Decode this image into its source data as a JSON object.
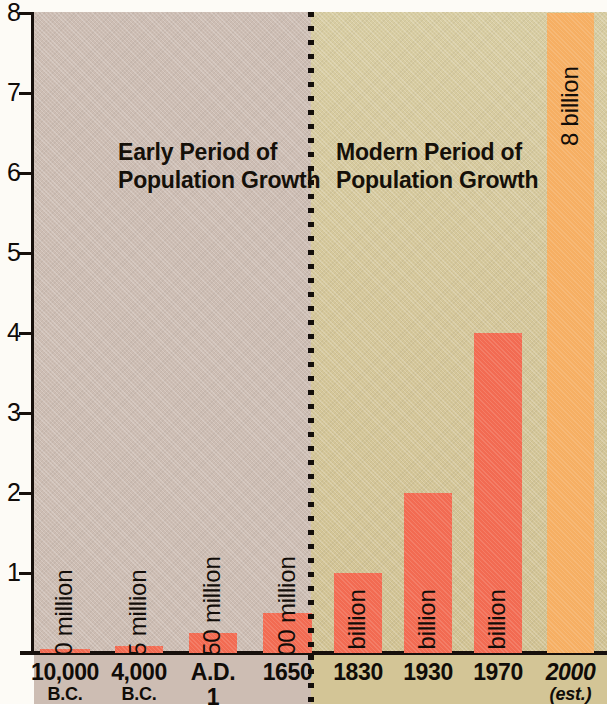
{
  "chart_data": {
    "type": "bar",
    "title": "",
    "xlabel": "",
    "ylabel": "",
    "ylim": [
      0,
      8
    ],
    "yticks": [
      1,
      2,
      3,
      4,
      5,
      6,
      7,
      8
    ],
    "ytick_labels": [
      "1",
      "2",
      "3",
      "4",
      "5",
      "6",
      "7",
      "8"
    ],
    "grid": false,
    "legend": "none",
    "unit_note": "y axis in billions of people",
    "categories": [
      "10,000 B.C.",
      "4,000 B.C.",
      "A.D. 1",
      "1650",
      "1830",
      "1930",
      "1970",
      "2000 (est.)"
    ],
    "values": [
      0.01,
      0.085,
      0.25,
      0.5,
      1,
      2,
      4,
      8
    ],
    "data_labels": [
      "10 million",
      "85 million",
      "250 million",
      "500 million",
      "1 billion",
      "2 billion",
      "4 billion",
      "8 billion"
    ],
    "bar_colors": [
      "#f26b52",
      "#f26b52",
      "#f26b52",
      "#f26b52",
      "#f26b52",
      "#f26b52",
      "#f26b52",
      "#f6af63"
    ],
    "annotations": [
      "Early Period of Population Growth",
      "Modern Period of Population Growth"
    ],
    "panel_divider_after_category": "1650"
  },
  "axis": {
    "ticks": [
      {
        "label": "8",
        "value": 8
      },
      {
        "label": "7",
        "value": 7
      },
      {
        "label": "6",
        "value": 6
      },
      {
        "label": "5",
        "value": 5
      },
      {
        "label": "4",
        "value": 4
      },
      {
        "label": "3",
        "value": 3
      },
      {
        "label": "2",
        "value": 2
      },
      {
        "label": "1",
        "value": 1
      }
    ]
  },
  "sections": {
    "early": {
      "title": "Early Period of\nPopulation Growth",
      "background_color": "#cdbdb3"
    },
    "modern": {
      "title": "Modern Period of\nPopulation Growth",
      "background_color": "#d3c596"
    }
  },
  "bars": [
    {
      "label": "10 million",
      "value": 0.01,
      "category_line1": "10,000",
      "category_line2": "B.C.",
      "color": "#f26b52"
    },
    {
      "label": "85 million",
      "value": 0.085,
      "category_line1": "4,000",
      "category_line2": "B.C.",
      "color": "#f26b52"
    },
    {
      "label": "250 million",
      "value": 0.25,
      "category_line1": "A.D.",
      "category_line2": "1",
      "color": "#f26b52"
    },
    {
      "label": "500 million",
      "value": 0.5,
      "category_line1": "1650",
      "category_line2": "",
      "color": "#f26b52"
    },
    {
      "label": "1 billion",
      "value": 1,
      "category_line1": "1830",
      "category_line2": "",
      "color": "#f26b52"
    },
    {
      "label": "2 billion",
      "value": 2,
      "category_line1": "1930",
      "category_line2": "",
      "color": "#f26b52"
    },
    {
      "label": "4 billion",
      "value": 4,
      "category_line1": "1970",
      "category_line2": "",
      "color": "#f26b52"
    },
    {
      "label": "8 billion",
      "value": 8,
      "category_line1": "2000",
      "category_line2": "(est.)",
      "color": "#f6af63"
    }
  ]
}
